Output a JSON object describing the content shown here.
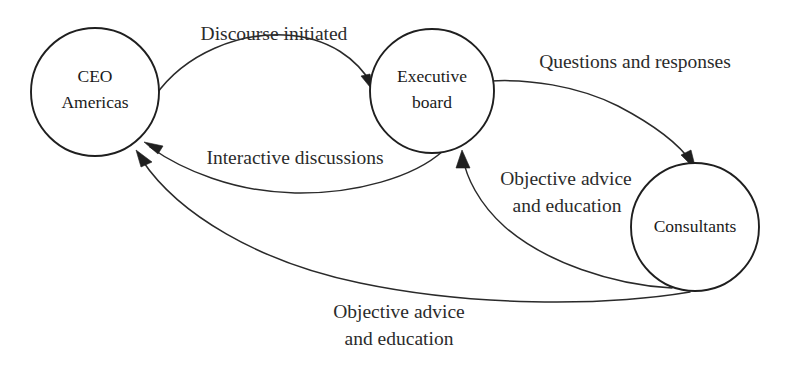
{
  "diagram": {
    "background_color": "#ffffff",
    "stroke_color": "#1f1f1f",
    "text_color": "#1a1a1a",
    "nodes": [
      {
        "id": "ceo-americas",
        "label_line1": "CEO",
        "label_line2": "Americas",
        "cx": 95,
        "cy": 92,
        "r": 64
      },
      {
        "id": "executive-board",
        "label_line1": "Executive",
        "label_line2": "board",
        "cx": 432,
        "cy": 91,
        "r": 62
      },
      {
        "id": "consultants",
        "label_line1": "Consultants",
        "label_line2": "",
        "cx": 695,
        "cy": 227,
        "r": 64
      }
    ],
    "edges": [
      {
        "id": "discourse-initiated",
        "from": "ceo-americas",
        "to": "executive-board",
        "label_line1": "Discourse initiated",
        "label_line2": "",
        "label_x": 274,
        "label_y": 36
      },
      {
        "id": "questions-and-responses",
        "from": "executive-board",
        "to": "consultants",
        "label_line1": "Questions and responses",
        "label_line2": "",
        "label_x": 635,
        "label_y": 64
      },
      {
        "id": "interactive-discussions",
        "from": "executive-board",
        "to": "ceo-americas",
        "label_line1": "Interactive discussions",
        "label_line2": "",
        "label_x": 295,
        "label_y": 160
      },
      {
        "id": "objective-advice-to-board",
        "from": "consultants",
        "to": "executive-board",
        "label_line1": "Objective advice",
        "label_line2": "and education",
        "label_x": 566,
        "label_y": 181
      },
      {
        "id": "objective-advice-to-ceo",
        "from": "consultants",
        "to": "ceo-americas",
        "label_line1": "Objective advice",
        "label_line2": "and education",
        "label_x": 399,
        "label_y": 314
      }
    ]
  }
}
